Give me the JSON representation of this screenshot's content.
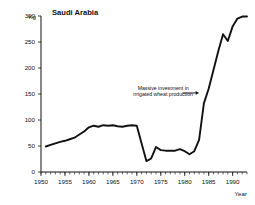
{
  "chart_data": {
    "type": "line",
    "title": "Saudi Arabia",
    "xlabel": "Year",
    "ylabel": "Kg",
    "yunit": "Kg",
    "xlim": [
      1950,
      1993
    ],
    "ylim": [
      0,
      300
    ],
    "yticks": [
      0,
      50,
      100,
      150,
      200,
      250,
      300
    ],
    "xticks": [
      1950,
      1955,
      1960,
      1965,
      1970,
      1975,
      1980,
      1985,
      1990
    ],
    "xtick_labels": [
      "1950",
      "1955",
      "1960",
      "1965",
      "1970",
      "1975",
      "1980",
      "1985",
      "1990"
    ],
    "ytick_labels": [
      "0",
      "50",
      "100",
      "150",
      "200",
      "250",
      "300"
    ],
    "x_minor_tick_step": 1,
    "grid": false,
    "legend": "none",
    "annotations": [
      {
        "text_line_1": "Massive investment in",
        "text_line_2": "irrigated wheat production",
        "x": 1975.5,
        "y": 158,
        "arrow_from_x": 1979.5,
        "arrow_to_x": 1983.0,
        "arrow_y": 152
      }
    ],
    "series": [
      {
        "name": "Saudi Arabia",
        "x": [
          1951,
          1952,
          1953,
          1954,
          1955,
          1956,
          1957,
          1958,
          1959,
          1960,
          1961,
          1962,
          1963,
          1964,
          1965,
          1966,
          1967,
          1968,
          1969,
          1970,
          1971,
          1972,
          1973,
          1974,
          1975,
          1976,
          1977,
          1978,
          1979,
          1980,
          1981,
          1982,
          1983,
          1984,
          1985,
          1986,
          1987,
          1988,
          1989,
          1990,
          1991,
          1992,
          1993
        ],
        "values": [
          49,
          52,
          55,
          58,
          60,
          63,
          66,
          72,
          78,
          86,
          89,
          87,
          90,
          89,
          90,
          88,
          87,
          89,
          90,
          89,
          55,
          21,
          26,
          48,
          42,
          41,
          41,
          41,
          44,
          40,
          34,
          40,
          62,
          132,
          160,
          196,
          232,
          265,
          252,
          280,
          295,
          299,
          299
        ]
      }
    ]
  }
}
